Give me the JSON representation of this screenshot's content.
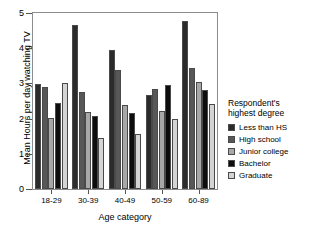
{
  "title_sliver": "……",
  "chart_data": {
    "type": "bar",
    "title": "",
    "xlabel": "Age category",
    "ylabel": "Mean Hours per day watching TV",
    "ylim": [
      0,
      5
    ],
    "yticks": [
      0,
      1,
      2,
      3,
      4,
      5
    ],
    "grid": false,
    "legend_position": "right",
    "legend_title": "Respondent's highest degree",
    "categories": [
      "18-29",
      "30-39",
      "40-49",
      "50-59",
      "60-89"
    ],
    "series": [
      {
        "name": "Less than HS",
        "color": "#2b2b2b",
        "values": [
          2.97,
          4.67,
          3.96,
          2.66,
          4.76
        ]
      },
      {
        "name": "High school",
        "color": "#575757",
        "values": [
          2.9,
          2.77,
          3.38,
          2.84,
          3.45
        ]
      },
      {
        "name": "Junior college",
        "color": "#a8a8a8",
        "values": [
          2.01,
          2.18,
          2.4,
          2.21,
          3.05
        ]
      },
      {
        "name": "Bachelor",
        "color": "#0d0d0d",
        "values": [
          2.44,
          2.07,
          2.15,
          2.95,
          2.81
        ]
      },
      {
        "name": "Graduate",
        "color": "#d4d4d4",
        "values": [
          3.02,
          1.46,
          1.57,
          1.98,
          2.41
        ]
      }
    ]
  },
  "legend": {
    "title_line1": "Respondent's",
    "title_line2": "highest degree",
    "items": [
      {
        "label": "Less than HS",
        "color": "#2b2b2b"
      },
      {
        "label": "High school",
        "color": "#575757"
      },
      {
        "label": "Junior college",
        "color": "#a8a8a8"
      },
      {
        "label": "Bachelor",
        "color": "#0d0d0d"
      },
      {
        "label": "Graduate",
        "color": "#d4d4d4"
      }
    ]
  }
}
